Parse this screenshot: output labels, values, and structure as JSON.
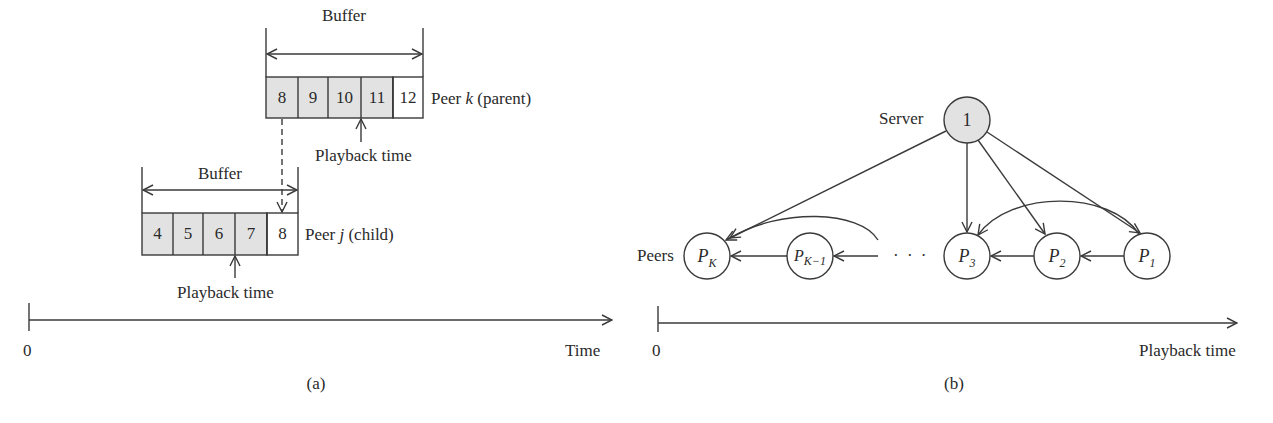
{
  "panel_a": {
    "caption": "(a)",
    "parent": {
      "buffer_label": "Buffer",
      "cells": [
        "8",
        "9",
        "10",
        "11",
        "12"
      ],
      "filled": [
        true,
        true,
        true,
        true,
        false
      ],
      "peer_label_prefix": "Peer ",
      "peer_var": "k",
      "peer_label_suffix": " (parent)",
      "playback_label": "Playback time"
    },
    "child": {
      "buffer_label": "Buffer",
      "cells": [
        "4",
        "5",
        "6",
        "7",
        "8"
      ],
      "filled": [
        true,
        true,
        true,
        true,
        false
      ],
      "peer_label_prefix": "Peer ",
      "peer_var": "j",
      "peer_label_suffix": " (child)",
      "playback_label": "Playback time"
    },
    "axis": {
      "origin": "0",
      "label": "Time"
    }
  },
  "panel_b": {
    "caption": "(b)",
    "server": {
      "label": "Server",
      "node": "1"
    },
    "peers_label": "Peers",
    "peers": [
      {
        "base": "P",
        "sub": "K"
      },
      {
        "base": "P",
        "sub": "K−1"
      },
      {
        "base": "P",
        "sub": "3"
      },
      {
        "base": "P",
        "sub": "2"
      },
      {
        "base": "P",
        "sub": "1"
      }
    ],
    "ellipsis": "· · ·",
    "axis": {
      "origin": "0",
      "label": "Playback time"
    }
  },
  "colors": {
    "fill": "#e2e2e2",
    "stroke": "#3a3a3a",
    "background": "#ffffff"
  }
}
